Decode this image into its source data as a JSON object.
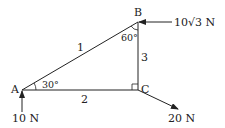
{
  "diagram": {
    "nodes": [
      {
        "id": "A",
        "label": "A"
      },
      {
        "id": "B",
        "label": "B"
      },
      {
        "id": "C",
        "label": "C"
      }
    ],
    "members": [
      {
        "id": "1",
        "label": "1",
        "from": "A",
        "to": "B"
      },
      {
        "id": "2",
        "label": "2",
        "from": "A",
        "to": "C"
      },
      {
        "id": "3",
        "label": "3",
        "from": "B",
        "to": "C"
      }
    ],
    "angles": {
      "A": "30°",
      "B": "60°",
      "C": "right-angle"
    },
    "forces": [
      {
        "at": "A",
        "label": "10 N",
        "direction": "up"
      },
      {
        "at": "B",
        "label": "10√3 N",
        "direction": "left"
      },
      {
        "at": "C",
        "label": "20 N",
        "direction": "down-right"
      }
    ],
    "colors": {
      "line": "#222222",
      "background": "#ffffff"
    }
  }
}
